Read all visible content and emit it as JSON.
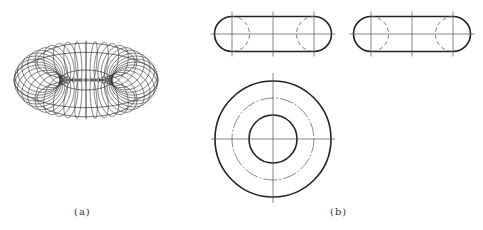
{
  "figure": {
    "labels": {
      "a": "(a)",
      "b": "(b)"
    },
    "panel_a": {
      "description": "Wireframe torus (ring) rendered with meridian circles",
      "center": [
        86,
        80
      ],
      "outer_radii": [
        72,
        55
      ],
      "hole_radii": [
        27,
        9
      ],
      "meridian_count": 40
    },
    "panel_b": {
      "description": "Orthographic views of a torus",
      "views": [
        {
          "name": "front-view",
          "shape": "stadium",
          "center": [
            273,
            34
          ],
          "half_length": 41,
          "radius": 17.5
        },
        {
          "name": "side-view",
          "shape": "stadium",
          "center": [
            412,
            34
          ],
          "half_length": 41,
          "radius": 17.5
        },
        {
          "name": "top-view",
          "shape": "concentric-circles",
          "center": [
            273,
            139
          ],
          "radii": {
            "outer": 58,
            "centerline": 41,
            "inner": 24
          }
        }
      ]
    },
    "colors": {
      "line": "#222222",
      "thin_line": "#555555",
      "background": "#ffffff"
    }
  }
}
